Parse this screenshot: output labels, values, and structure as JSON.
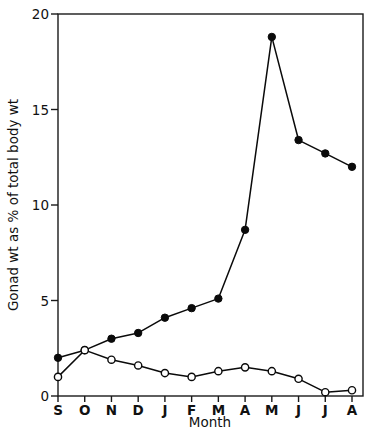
{
  "chart_data": {
    "type": "line",
    "title": "",
    "xlabel": "Month",
    "ylabel": "Gonad wt as % of total body wt",
    "categories": [
      "S",
      "O",
      "N",
      "D",
      "J",
      "F",
      "M",
      "A",
      "M",
      "J",
      "J",
      "A"
    ],
    "xlim": [
      0,
      11
    ],
    "ylim": [
      0,
      20
    ],
    "yticks": [
      0,
      5,
      10,
      15,
      20
    ],
    "ytick_labels": [
      "0",
      "5",
      "10",
      "15",
      "20"
    ],
    "grid": false,
    "legend": "none",
    "series": [
      {
        "name": "filled-circle-series",
        "marker": "filled-circle",
        "values": [
          2.0,
          2.4,
          3.0,
          3.3,
          4.1,
          4.6,
          5.1,
          8.7,
          18.8,
          13.4,
          12.7,
          12.0
        ]
      },
      {
        "name": "open-circle-series",
        "marker": "open-circle",
        "values": [
          1.0,
          2.4,
          1.9,
          1.6,
          1.2,
          1.0,
          1.3,
          1.5,
          1.3,
          0.9,
          0.2,
          0.3
        ]
      }
    ]
  },
  "axes": {
    "y_axis_label": "Gonad wt as % of total body wt",
    "x_axis_label": "Month"
  }
}
